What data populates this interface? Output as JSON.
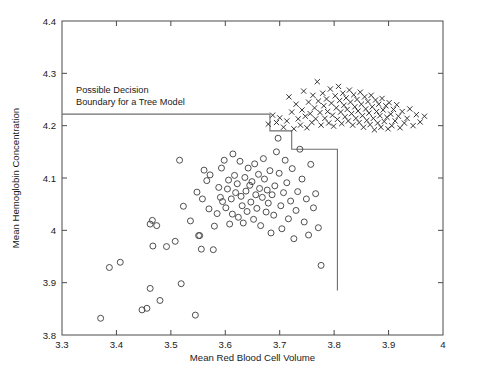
{
  "chart_data": {
    "type": "scatter",
    "title": "",
    "xlabel": "Mean Red Blood Cell Volume",
    "ylabel": "Mean Hemoglobin Concentration",
    "xlim": [
      3.3,
      4.0
    ],
    "ylim": [
      3.8,
      4.4
    ],
    "xticks": [
      3.3,
      3.4,
      3.5,
      3.6,
      3.7,
      3.8,
      3.9,
      4
    ],
    "xticklabels": [
      "3.3",
      "3.4",
      "3.5",
      "3.6",
      "3.7",
      "3.8",
      "3.9",
      "4"
    ],
    "yticks": [
      3.8,
      3.9,
      4.0,
      4.1,
      4.2,
      4.3,
      4.4
    ],
    "yticklabels": [
      "3.8",
      "3.9",
      "4",
      "4.1",
      "4.2",
      "4.3",
      "4.4"
    ],
    "grid": false,
    "legend": null,
    "frame": "box",
    "tick_direction": "in",
    "annotations": [
      {
        "name": "decision-boundary-annotation",
        "lines": [
          "Possible Decision",
          "Boundary for a Tree Model"
        ],
        "x": 3.37,
        "y": 4.285
      }
    ],
    "series": [
      {
        "name": "group-circles",
        "marker": "circle",
        "color": "#3c3c3c",
        "points": [
          [
            3.371,
            3.832
          ],
          [
            3.387,
            3.929
          ],
          [
            3.407,
            3.939
          ],
          [
            3.447,
            3.848
          ],
          [
            3.456,
            3.851
          ],
          [
            3.462,
            3.889
          ],
          [
            3.462,
            4.012
          ],
          [
            3.466,
            4.019
          ],
          [
            3.467,
            3.97
          ],
          [
            3.474,
            4.009
          ],
          [
            3.48,
            3.866
          ],
          [
            3.492,
            3.969
          ],
          [
            3.508,
            3.979
          ],
          [
            3.516,
            4.134
          ],
          [
            3.519,
            3.898
          ],
          [
            3.523,
            4.046
          ],
          [
            3.536,
            4.018
          ],
          [
            3.545,
            3.838
          ],
          [
            3.548,
            4.073
          ],
          [
            3.551,
            3.99
          ],
          [
            3.553,
            3.99
          ],
          [
            3.556,
            3.964
          ],
          [
            3.558,
            4.06
          ],
          [
            3.561,
            4.115
          ],
          [
            3.566,
            4.095
          ],
          [
            3.57,
            4.041
          ],
          [
            3.572,
            4.106
          ],
          [
            3.578,
            3.963
          ],
          [
            3.58,
            4.008
          ],
          [
            3.585,
            4.032
          ],
          [
            3.588,
            4.082
          ],
          [
            3.591,
            4.063
          ],
          [
            3.593,
            4.119
          ],
          [
            3.595,
            4.055
          ],
          [
            3.598,
            4.134
          ],
          [
            3.601,
            4.043
          ],
          [
            3.604,
            4.079
          ],
          [
            3.606,
            4.096
          ],
          [
            3.608,
            4.012
          ],
          [
            3.611,
            4.06
          ],
          [
            3.613,
            4.031
          ],
          [
            3.614,
            4.146
          ],
          [
            3.617,
            4.105
          ],
          [
            3.619,
            4.072
          ],
          [
            3.622,
            4.089
          ],
          [
            3.624,
            4.025
          ],
          [
            3.627,
            4.132
          ],
          [
            3.629,
            4.065
          ],
          [
            3.631,
            4.047
          ],
          [
            3.633,
            4.014
          ],
          [
            3.636,
            4.101
          ],
          [
            3.638,
            4.075
          ],
          [
            3.64,
            4.036
          ],
          [
            3.642,
            4.119
          ],
          [
            3.645,
            4.086
          ],
          [
            3.647,
            4.054
          ],
          [
            3.649,
            4.093
          ],
          [
            3.652,
            4.021
          ],
          [
            3.654,
            4.127
          ],
          [
            3.656,
            4.068
          ],
          [
            3.658,
            4.042
          ],
          [
            3.661,
            4.107
          ],
          [
            3.663,
            4.08
          ],
          [
            3.665,
            4.009
          ],
          [
            3.668,
            4.063
          ],
          [
            3.67,
            4.137
          ],
          [
            3.672,
            4.098
          ],
          [
            3.675,
            4.035
          ],
          [
            3.677,
            4.077
          ],
          [
            3.679,
            4.052
          ],
          [
            3.682,
            4.114
          ],
          [
            3.684,
            3.995
          ],
          [
            3.686,
            4.068
          ],
          [
            3.689,
            4.029
          ],
          [
            3.691,
            4.085
          ],
          [
            3.694,
            4.15
          ],
          [
            3.697,
            4.176
          ],
          [
            3.699,
            4.109
          ],
          [
            3.702,
            4.047
          ],
          [
            3.704,
            4.003
          ],
          [
            3.707,
            4.072
          ],
          [
            3.71,
            4.134
          ],
          [
            3.713,
            4.091
          ],
          [
            3.716,
            4.022
          ],
          [
            3.72,
            4.056
          ],
          [
            3.723,
            4.118
          ],
          [
            3.726,
            3.984
          ],
          [
            3.73,
            4.038
          ],
          [
            3.733,
            4.074
          ],
          [
            3.737,
            4.155
          ],
          [
            3.741,
            4.098
          ],
          [
            3.745,
            4.016
          ],
          [
            3.749,
            4.06
          ],
          [
            3.753,
            3.991
          ],
          [
            3.757,
            4.126
          ],
          [
            3.762,
            4.043
          ],
          [
            3.766,
            4.07
          ],
          [
            3.771,
            4.005
          ],
          [
            3.776,
            3.933
          ]
        ]
      },
      {
        "name": "group-crosses",
        "marker": "x",
        "color": "#2b2b2b",
        "points": [
          [
            3.679,
            4.203
          ],
          [
            3.687,
            4.22
          ],
          [
            3.694,
            4.206
          ],
          [
            3.7,
            4.215
          ],
          [
            3.707,
            4.197
          ],
          [
            3.713,
            4.209
          ],
          [
            3.717,
            4.255
          ],
          [
            3.722,
            4.226
          ],
          [
            3.726,
            4.194
          ],
          [
            3.73,
            4.241
          ],
          [
            3.734,
            4.213
          ],
          [
            3.738,
            4.201
          ],
          [
            3.741,
            4.23
          ],
          [
            3.744,
            4.266
          ],
          [
            3.747,
            4.218
          ],
          [
            3.75,
            4.196
          ],
          [
            3.753,
            4.245
          ],
          [
            3.756,
            4.223
          ],
          [
            3.759,
            4.206
          ],
          [
            3.761,
            4.258
          ],
          [
            3.764,
            4.234
          ],
          [
            3.766,
            4.213
          ],
          [
            3.769,
            4.284
          ],
          [
            3.771,
            4.247
          ],
          [
            3.774,
            4.225
          ],
          [
            3.776,
            4.201
          ],
          [
            3.779,
            4.262
          ],
          [
            3.781,
            4.238
          ],
          [
            3.783,
            4.214
          ],
          [
            3.786,
            4.251
          ],
          [
            3.788,
            4.227
          ],
          [
            3.79,
            4.205
          ],
          [
            3.793,
            4.27
          ],
          [
            3.795,
            4.243
          ],
          [
            3.797,
            4.22
          ],
          [
            3.799,
            4.199
          ],
          [
            3.802,
            4.257
          ],
          [
            3.804,
            4.234
          ],
          [
            3.806,
            4.212
          ],
          [
            3.808,
            4.275
          ],
          [
            3.81,
            4.248
          ],
          [
            3.812,
            4.226
          ],
          [
            3.814,
            4.204
          ],
          [
            3.816,
            4.262
          ],
          [
            3.818,
            4.239
          ],
          [
            3.82,
            4.217
          ],
          [
            3.822,
            4.253
          ],
          [
            3.824,
            4.231
          ],
          [
            3.826,
            4.209
          ],
          [
            3.828,
            4.268
          ],
          [
            3.83,
            4.245
          ],
          [
            3.832,
            4.223
          ],
          [
            3.834,
            4.201
          ],
          [
            3.836,
            4.259
          ],
          [
            3.838,
            4.236
          ],
          [
            3.84,
            4.214
          ],
          [
            3.842,
            4.25
          ],
          [
            3.844,
            4.228
          ],
          [
            3.846,
            4.206
          ],
          [
            3.848,
            4.264
          ],
          [
            3.85,
            4.241
          ],
          [
            3.852,
            4.219
          ],
          [
            3.854,
            4.197
          ],
          [
            3.856,
            4.255
          ],
          [
            3.858,
            4.232
          ],
          [
            3.86,
            4.21
          ],
          [
            3.862,
            4.246
          ],
          [
            3.864,
            4.224
          ],
          [
            3.866,
            4.202
          ],
          [
            3.868,
            4.258
          ],
          [
            3.87,
            4.236
          ],
          [
            3.872,
            4.214
          ],
          [
            3.874,
            4.192
          ],
          [
            3.876,
            4.249
          ],
          [
            3.878,
            4.227
          ],
          [
            3.88,
            4.205
          ],
          [
            3.882,
            4.241
          ],
          [
            3.884,
            4.219
          ],
          [
            3.886,
            4.197
          ],
          [
            3.888,
            4.252
          ],
          [
            3.89,
            4.23
          ],
          [
            3.892,
            4.208
          ],
          [
            3.895,
            4.238
          ],
          [
            3.897,
            4.216
          ],
          [
            3.899,
            4.194
          ],
          [
            3.901,
            4.244
          ],
          [
            3.904,
            4.222
          ],
          [
            3.906,
            4.2
          ],
          [
            3.909,
            4.231
          ],
          [
            3.912,
            4.209
          ],
          [
            3.915,
            4.24
          ],
          [
            3.918,
            4.218
          ],
          [
            3.921,
            4.196
          ],
          [
            3.925,
            4.227
          ],
          [
            3.929,
            4.205
          ],
          [
            3.934,
            4.214
          ],
          [
            3.939,
            4.232
          ],
          [
            3.945,
            4.2
          ],
          [
            3.951,
            4.221
          ],
          [
            3.958,
            4.207
          ],
          [
            3.966,
            4.218
          ]
        ]
      }
    ],
    "decision_boundary": {
      "name": "tree-decision-boundary",
      "color": "#6e6e6e",
      "description": "Axis-aligned staircase decision boundary",
      "vertices": [
        [
          3.3,
          4.222
        ],
        [
          3.682,
          4.222
        ],
        [
          3.682,
          4.19
        ],
        [
          3.722,
          4.19
        ],
        [
          3.722,
          4.155
        ],
        [
          3.806,
          4.155
        ],
        [
          3.806,
          3.885
        ]
      ]
    }
  },
  "geometry": {
    "plot_left": 62,
    "plot_right": 443,
    "plot_top": 21,
    "plot_bottom": 335
  }
}
